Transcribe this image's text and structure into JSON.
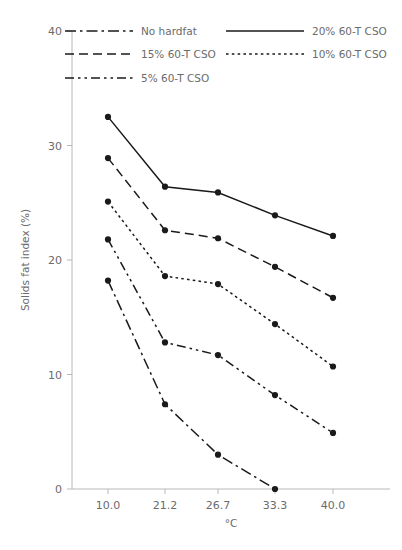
{
  "chart_data": {
    "type": "line",
    "title": "",
    "xlabel": "°C",
    "ylabel": "Solids fat index (%)",
    "categories": [
      "10.0",
      "21.2",
      "26.7",
      "33.3",
      "40.0"
    ],
    "xlim": [
      0,
      4
    ],
    "ylim": [
      0,
      40
    ],
    "yticks": [
      0,
      10,
      20,
      30,
      40
    ],
    "ytick_labels": [
      "0",
      "10",
      "20",
      "30",
      "40"
    ],
    "xtick_labels": [
      "10.0",
      "21.2",
      "26.7",
      "33.3",
      "40.0"
    ],
    "grid": false,
    "legend_position": "upper-left-inside",
    "marker": "filled-circle",
    "line_color": "#1a1a1a",
    "axis_color": "#b8b8b8",
    "text_color": "#6b6b6b",
    "series": [
      {
        "name": "20% 60-T CSO",
        "dash": "solid",
        "values": [
          32.5,
          26.4,
          25.9,
          23.9,
          22.1
        ]
      },
      {
        "name": "15% 60-T CSO",
        "dash": "dashed",
        "values": [
          28.9,
          22.6,
          21.9,
          19.4,
          16.7
        ]
      },
      {
        "name": "10% 60-T CSO",
        "dash": "dotted",
        "values": [
          25.1,
          18.6,
          17.9,
          14.4,
          10.7
        ]
      },
      {
        "name": "5% 60-T CSO",
        "dash": "dashdotdot",
        "values": [
          21.8,
          12.8,
          11.7,
          8.2,
          4.9
        ]
      },
      {
        "name": "No hardfat",
        "dash": "dashdot",
        "values": [
          18.2,
          7.4,
          3.0,
          0.0,
          null
        ]
      }
    ],
    "legend_entries": [
      {
        "label": "No hardfat",
        "dash": "dashdot",
        "col": 0,
        "row": 0
      },
      {
        "label": "20% 60-T CSO",
        "dash": "solid",
        "col": 1,
        "row": 0
      },
      {
        "label": "15% 60-T CSO",
        "dash": "dashed",
        "col": 0,
        "row": 1
      },
      {
        "label": "10% 60-T CSO",
        "dash": "dotted",
        "col": 1,
        "row": 1
      },
      {
        "label": "5% 60-T CSO",
        "dash": "dashdotdot",
        "col": 0,
        "row": 2
      }
    ]
  }
}
